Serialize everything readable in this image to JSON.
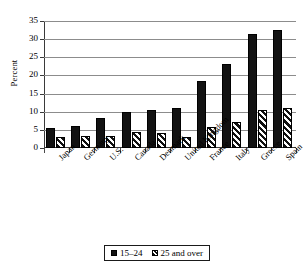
{
  "chart_data": {
    "type": "bar",
    "title": "",
    "xlabel": "",
    "ylabel": "Percent",
    "ylim": [
      0,
      35
    ],
    "ytick_values": [
      0,
      5,
      10,
      15,
      20,
      25,
      30,
      35
    ],
    "ytick_labels": [
      "0",
      "5",
      "10",
      "15",
      "20",
      "25",
      "30",
      "35"
    ],
    "grid": true,
    "legend_position": "bottom-center",
    "categories": [
      "Japan",
      "Germany",
      "U.S.",
      "Canada",
      "Denmark",
      "United Kingdom",
      "France",
      "Italy",
      "Greece",
      "Spain"
    ],
    "series": [
      {
        "name": "15–24",
        "pattern": "solid",
        "color": "#121212",
        "values": [
          5.5,
          6.0,
          8.2,
          10.0,
          10.4,
          11.0,
          18.4,
          23.2,
          31.4,
          32.6
        ]
      },
      {
        "name": "25 and over",
        "pattern": "diagonal-hatch",
        "color": "#111111",
        "values": [
          2.9,
          3.3,
          3.4,
          4.5,
          4.2,
          3.0,
          5.9,
          7.3,
          10.5,
          11.0
        ]
      }
    ]
  },
  "legend": {
    "entries": [
      {
        "label": "15–24",
        "swatch": "solid-square"
      },
      {
        "label": "25 and over",
        "swatch": "hatched-square"
      }
    ]
  },
  "axis": {
    "y_title": "Percent"
  }
}
